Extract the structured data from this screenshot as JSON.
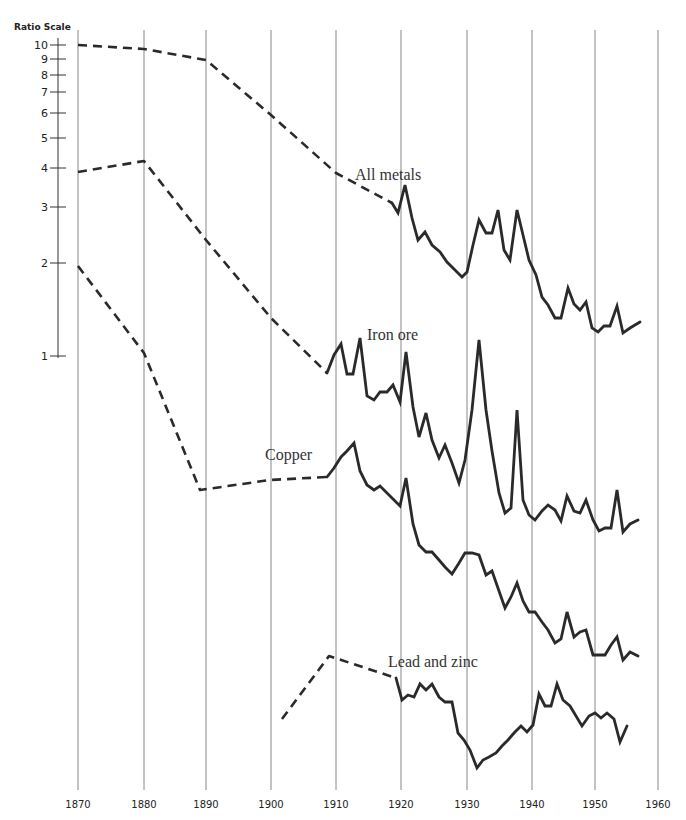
{
  "chart_data": {
    "type": "line",
    "title": "",
    "xlabel": "",
    "ylabel": "Ratio Scale",
    "y_scale": "log",
    "ylim": [
      1,
      10
    ],
    "xlim": [
      1870,
      1960
    ],
    "grid": {
      "vertical": true,
      "horizontal": false
    },
    "legend": "inline labels",
    "y_ticks": [
      1,
      2,
      3,
      4,
      5,
      6,
      7,
      8,
      9,
      10
    ],
    "x_ticks": [
      1870,
      1880,
      1890,
      1900,
      1910,
      1920,
      1930,
      1940,
      1950,
      1960
    ],
    "note": "Series are vertically offset on the ratio scale; dashed segments indicate decennial/interpolated data, solid segments annual data.",
    "series": [
      {
        "name": "All metals",
        "label_pos": [
          355,
          180
        ],
        "dashed_points": [
          [
            78,
            45
          ],
          [
            144,
            49
          ],
          [
            206,
            60
          ],
          [
            271,
            115
          ],
          [
            336,
            173
          ],
          [
            392,
            203
          ]
        ],
        "solid_points": [
          [
            392,
            203
          ],
          [
            398,
            213
          ],
          [
            405,
            185
          ],
          [
            412,
            218
          ],
          [
            418,
            240
          ],
          [
            425,
            232
          ],
          [
            432,
            245
          ],
          [
            440,
            252
          ],
          [
            447,
            262
          ],
          [
            455,
            270
          ],
          [
            462,
            277
          ],
          [
            467,
            272
          ],
          [
            473,
            245
          ],
          [
            479,
            220
          ],
          [
            486,
            233
          ],
          [
            492,
            233
          ],
          [
            498,
            210
          ],
          [
            504,
            250
          ],
          [
            510,
            260
          ],
          [
            517,
            210
          ],
          [
            523,
            235
          ],
          [
            529,
            260
          ],
          [
            536,
            275
          ],
          [
            542,
            297
          ],
          [
            548,
            305
          ],
          [
            555,
            318
          ],
          [
            561,
            318
          ],
          [
            568,
            288
          ],
          [
            574,
            304
          ],
          [
            580,
            310
          ],
          [
            586,
            302
          ],
          [
            592,
            328
          ],
          [
            598,
            332
          ],
          [
            604,
            326
          ],
          [
            610,
            326
          ],
          [
            617,
            306
          ],
          [
            623,
            333
          ],
          [
            630,
            328
          ],
          [
            640,
            322
          ]
        ],
        "values_est": [
          [
            1870,
            10
          ],
          [
            1880,
            9.7
          ],
          [
            1890,
            9.0
          ],
          [
            1900,
            6.4
          ],
          [
            1910,
            4.1
          ],
          [
            1919,
            3.3
          ],
          [
            1921,
            3.5
          ],
          [
            1929,
            2.0
          ],
          [
            1937,
            2.9
          ],
          [
            1949,
            1.4
          ],
          [
            1958,
            1.3
          ]
        ]
      },
      {
        "name": "Iron ore",
        "label_pos": [
          367,
          340
        ],
        "dashed_points": [
          [
            78,
            172
          ],
          [
            144,
            161
          ],
          [
            206,
            240
          ],
          [
            271,
            318
          ],
          [
            327,
            373
          ]
        ],
        "solid_points": [
          [
            327,
            373
          ],
          [
            334,
            355
          ],
          [
            341,
            344
          ],
          [
            347,
            374
          ],
          [
            353,
            374
          ],
          [
            360,
            338
          ],
          [
            367,
            396
          ],
          [
            374,
            400
          ],
          [
            380,
            392
          ],
          [
            387,
            392
          ],
          [
            393,
            385
          ],
          [
            400,
            402
          ],
          [
            406,
            352
          ],
          [
            413,
            407
          ],
          [
            419,
            437
          ],
          [
            426,
            413
          ],
          [
            432,
            440
          ],
          [
            439,
            458
          ],
          [
            445,
            445
          ],
          [
            452,
            463
          ],
          [
            459,
            483
          ],
          [
            465,
            460
          ],
          [
            472,
            410
          ],
          [
            479,
            340
          ],
          [
            486,
            410
          ],
          [
            492,
            451
          ],
          [
            499,
            493
          ],
          [
            505,
            513
          ],
          [
            511,
            508
          ],
          [
            517,
            410
          ],
          [
            523,
            500
          ],
          [
            529,
            515
          ],
          [
            535,
            520
          ],
          [
            542,
            511
          ],
          [
            548,
            505
          ],
          [
            555,
            510
          ],
          [
            561,
            521
          ],
          [
            567,
            496
          ],
          [
            574,
            511
          ],
          [
            580,
            513
          ],
          [
            586,
            500
          ],
          [
            593,
            520
          ],
          [
            599,
            531
          ],
          [
            605,
            528
          ],
          [
            611,
            528
          ],
          [
            617,
            490
          ],
          [
            623,
            532
          ],
          [
            630,
            524
          ],
          [
            638,
            520
          ]
        ],
        "values_est": [
          [
            1870,
            3.9
          ],
          [
            1880,
            4.2
          ],
          [
            1890,
            2.4
          ],
          [
            1900,
            1.3
          ],
          [
            1909,
            0.87
          ],
          [
            1933,
            1.0
          ],
          [
            1940,
            0.45
          ],
          [
            1958,
            0.42
          ]
        ]
      },
      {
        "name": "Copper",
        "label_pos": [
          265,
          460
        ],
        "dashed_points": [
          [
            78,
            266
          ],
          [
            144,
            353
          ],
          [
            200,
            490
          ],
          [
            270,
            480
          ],
          [
            327,
            477
          ]
        ],
        "solid_points": [
          [
            327,
            477
          ],
          [
            334,
            468
          ],
          [
            341,
            457
          ],
          [
            347,
            451
          ],
          [
            354,
            443
          ],
          [
            360,
            471
          ],
          [
            367,
            485
          ],
          [
            374,
            490
          ],
          [
            380,
            486
          ],
          [
            387,
            493
          ],
          [
            393,
            499
          ],
          [
            400,
            506
          ],
          [
            406,
            478
          ],
          [
            413,
            524
          ],
          [
            419,
            545
          ],
          [
            426,
            552
          ],
          [
            432,
            552
          ],
          [
            439,
            560
          ],
          [
            445,
            567
          ],
          [
            452,
            574
          ],
          [
            459,
            563
          ],
          [
            465,
            553
          ],
          [
            472,
            553
          ],
          [
            479,
            555
          ],
          [
            486,
            575
          ],
          [
            492,
            571
          ],
          [
            499,
            591
          ],
          [
            505,
            608
          ],
          [
            511,
            597
          ],
          [
            517,
            583
          ],
          [
            523,
            601
          ],
          [
            529,
            612
          ],
          [
            535,
            612
          ],
          [
            542,
            622
          ],
          [
            548,
            630
          ],
          [
            555,
            643
          ],
          [
            561,
            639
          ],
          [
            567,
            612
          ],
          [
            574,
            637
          ],
          [
            580,
            632
          ],
          [
            586,
            630
          ],
          [
            593,
            655
          ],
          [
            599,
            655
          ],
          [
            605,
            655
          ],
          [
            611,
            645
          ],
          [
            617,
            637
          ],
          [
            623,
            660
          ],
          [
            630,
            652
          ],
          [
            638,
            656
          ]
        ],
        "values_est": [
          [
            1870,
            1.9
          ],
          [
            1880,
            1.0
          ],
          [
            1890,
            0.37
          ],
          [
            1900,
            0.38
          ],
          [
            1909,
            0.39
          ],
          [
            1957,
            0.12
          ]
        ]
      },
      {
        "name": "Lead and zinc",
        "label_pos": [
          388,
          667
        ],
        "dashed_points": [
          [
            282,
            719
          ],
          [
            329,
            656
          ],
          [
            396,
            678
          ]
        ],
        "solid_points": [
          [
            396,
            678
          ],
          [
            402,
            700
          ],
          [
            408,
            695
          ],
          [
            414,
            697
          ],
          [
            420,
            684
          ],
          [
            426,
            690
          ],
          [
            432,
            684
          ],
          [
            439,
            697
          ],
          [
            445,
            702
          ],
          [
            452,
            702
          ],
          [
            458,
            733
          ],
          [
            464,
            740
          ],
          [
            470,
            750
          ],
          [
            477,
            768
          ],
          [
            483,
            760
          ],
          [
            489,
            757
          ],
          [
            496,
            753
          ],
          [
            502,
            746
          ],
          [
            508,
            740
          ],
          [
            514,
            733
          ],
          [
            521,
            726
          ],
          [
            527,
            732
          ],
          [
            533,
            725
          ],
          [
            539,
            694
          ],
          [
            545,
            706
          ],
          [
            551,
            706
          ],
          [
            557,
            684
          ],
          [
            563,
            700
          ],
          [
            570,
            706
          ],
          [
            576,
            716
          ],
          [
            582,
            726
          ],
          [
            589,
            716
          ],
          [
            595,
            713
          ],
          [
            601,
            718
          ],
          [
            607,
            713
          ],
          [
            614,
            719
          ],
          [
            620,
            742
          ],
          [
            627,
            726
          ]
        ],
        "values_est": [
          [
            1902,
            0.05
          ],
          [
            1909,
            0.08
          ],
          [
            1919,
            0.07
          ],
          [
            1932,
            0.03
          ],
          [
            1945,
            0.06
          ],
          [
            1958,
            0.045
          ]
        ]
      }
    ]
  },
  "axis": {
    "title": "Ratio Scale",
    "y_ticks": [
      {
        "label": "10",
        "y": 45
      },
      {
        "label": "9",
        "y": 59
      },
      {
        "label": "8",
        "y": 75
      },
      {
        "label": "7",
        "y": 92
      },
      {
        "label": "6",
        "y": 113
      },
      {
        "label": "5",
        "y": 138
      },
      {
        "label": "4",
        "y": 168
      },
      {
        "label": "3",
        "y": 207
      },
      {
        "label": "2",
        "y": 263
      },
      {
        "label": "1",
        "y": 356
      }
    ],
    "x_ticks": [
      {
        "label": "1870",
        "x": 78
      },
      {
        "label": "1880",
        "x": 144
      },
      {
        "label": "1890",
        "x": 206
      },
      {
        "label": "1900",
        "x": 271
      },
      {
        "label": "1910",
        "x": 336
      },
      {
        "label": "1920",
        "x": 401
      },
      {
        "label": "1930",
        "x": 467
      },
      {
        "label": "1940",
        "x": 532
      },
      {
        "label": "1950",
        "x": 595
      },
      {
        "label": "1960",
        "x": 658
      }
    ]
  },
  "labels": {
    "all_metals": "All metals",
    "iron_ore": "Iron ore",
    "copper": "Copper",
    "lead_zinc": "Lead and zinc"
  }
}
